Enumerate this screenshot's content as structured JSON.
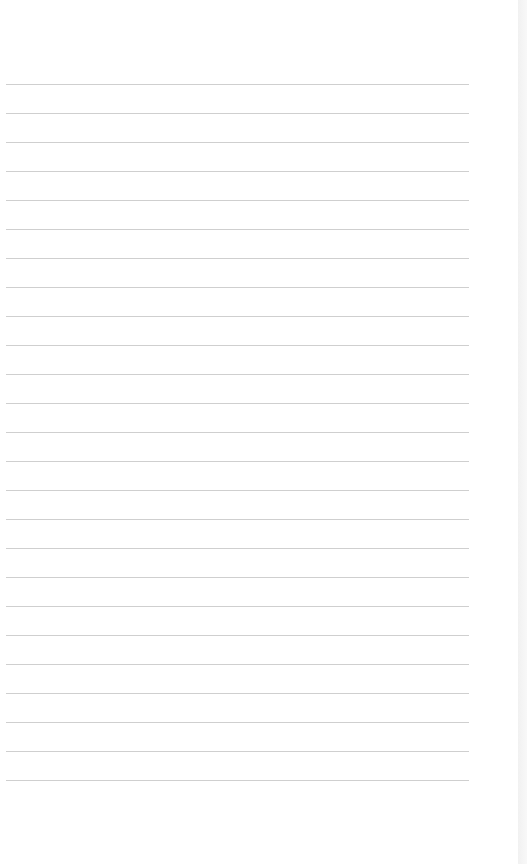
{
  "page": {
    "type": "lined-paper",
    "background_color": "#ffffff",
    "rule_color": "#cfcfcf",
    "rule_count": 25,
    "first_rule_y": 84,
    "rule_spacing": 29,
    "rule_left": 6,
    "rule_width": 463
  }
}
